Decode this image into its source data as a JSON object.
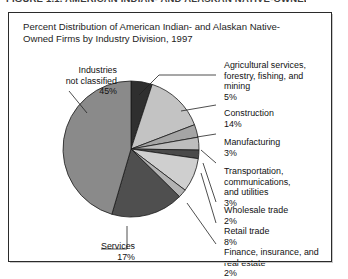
{
  "cut_heading": "FIGURE 1.1. AMERICAN INDIAN- AND ALASKAN NATIVE-OWNED FIRMS",
  "chart_title": "Percent Distribution of American Indian- and Alaskan Native-Owned Firms by Industry Division, 1997",
  "labels": {
    "industries_not_classified": "Industries\nnot classified",
    "industries_not_classified_pct": "45%",
    "services": "Services",
    "services_pct": "17%",
    "agricultural": "Agricultural services,\nforestry, fishing, and\nmining",
    "agricultural_pct": "5%",
    "construction": "Construction",
    "construction_pct": "14%",
    "manufacturing": "Manufacturing",
    "manufacturing_pct": "3%",
    "transportation": "Transportation,\ncommunications,\nand utilities",
    "transportation_pct": "3%",
    "wholesale": "Wholesale trade",
    "wholesale_pct": "2%",
    "retail": "Retail trade",
    "retail_pct": "8%",
    "finance": "Finance, insurance, and\nreal estate",
    "finance_pct": "2%"
  },
  "chart_data": {
    "type": "pie",
    "title": "Percent Distribution of American Indian- and Alaskan Native-Owned Firms by Industry Division, 1997",
    "unit": "percent",
    "start_angle_deg": 0,
    "direction": "clockwise",
    "legend_position": "callout-labels",
    "grid": false,
    "categories": [
      "Agricultural services, forestry, fishing, and mining",
      "Construction",
      "Manufacturing",
      "Transportation, communications, and utilities",
      "Wholesale trade",
      "Retail trade",
      "Finance, insurance, and real estate",
      "Services",
      "Industries not classified"
    ],
    "values": [
      5,
      14,
      3,
      3,
      2,
      8,
      2,
      17,
      45
    ],
    "colors": [
      "#2f2f2f",
      "#c3c3c3",
      "#a5a5a5",
      "#bdbdbd",
      "#4a4a4a",
      "#cfcfcf",
      "#b3b3b3",
      "#4f4f4f",
      "#8a8a8a"
    ]
  }
}
